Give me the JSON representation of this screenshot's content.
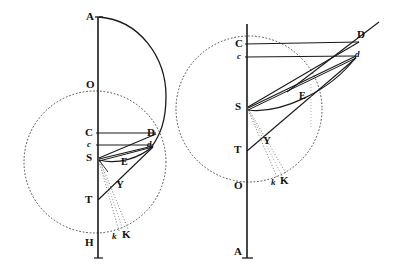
{
  "figure": {
    "background_color": "#ffffff",
    "ink_color": "#1a1a1a",
    "dotted_color": "#555555",
    "width": 393,
    "height": 271,
    "panels": [
      {
        "name": "left-panel",
        "axis": {
          "name": "vertical-axis",
          "x": 98,
          "y_top": 17,
          "y_bottom": 258
        },
        "solid_circle": {
          "name": "major-arc",
          "cx": 98,
          "cy": 79,
          "r": 66,
          "note": "large solid arc from A bulging right down past D"
        },
        "dotted_circle": {
          "name": "dotted-circle",
          "cx": 95,
          "cy": 162,
          "r": 71
        },
        "points": [
          {
            "label": "A",
            "x": 98,
            "y": 17,
            "label_x": 86,
            "label_y": 11,
            "style": "cap"
          },
          {
            "label": "O",
            "x": 98,
            "y": 85,
            "label_x": 86,
            "label_y": 79,
            "style": "cap"
          },
          {
            "label": "C",
            "x": 98,
            "y": 133,
            "label_x": 85,
            "label_y": 127,
            "style": "cap"
          },
          {
            "label": "c",
            "x": 98,
            "y": 145,
            "label_x": 87,
            "label_y": 140,
            "style": "small"
          },
          {
            "label": "S",
            "x": 98,
            "y": 158,
            "label_x": 86,
            "label_y": 152,
            "style": "cap"
          },
          {
            "label": "T",
            "x": 98,
            "y": 200,
            "label_x": 85,
            "label_y": 194,
            "style": "cap"
          },
          {
            "label": "H",
            "x": 98,
            "y": 243,
            "label_x": 85,
            "label_y": 237,
            "style": "cap"
          },
          {
            "label": "D",
            "x": 155,
            "y": 133,
            "label_x": 147,
            "label_y": 127,
            "style": "cap"
          },
          {
            "label": "d",
            "x": 152,
            "y": 145,
            "label_x": 147,
            "label_y": 140,
            "style": "small"
          },
          {
            "label": "E",
            "x": 127,
            "y": 160,
            "label_x": 121,
            "label_y": 157,
            "style": "smallcap"
          },
          {
            "label": "Y",
            "x": 123,
            "y": 181,
            "label_x": 116,
            "label_y": 179,
            "style": "cap"
          },
          {
            "label": "k",
            "x": 117,
            "y": 234,
            "label_x": 112,
            "label_y": 232,
            "style": "small"
          },
          {
            "label": "K",
            "x": 127,
            "y": 233,
            "label_x": 122,
            "label_y": 229,
            "style": "cap"
          }
        ]
      },
      {
        "name": "right-panel",
        "axis": {
          "name": "vertical-axis",
          "x": 247,
          "y_top": 24,
          "y_bottom": 258
        },
        "dotted_circle": {
          "name": "dotted-circle",
          "cx": 249,
          "cy": 109,
          "r": 73
        },
        "points": [
          {
            "label": "C",
            "x": 247,
            "y": 44,
            "label_x": 235,
            "label_y": 38,
            "style": "cap"
          },
          {
            "label": "c",
            "x": 247,
            "y": 57,
            "label_x": 237,
            "label_y": 52,
            "style": "small"
          },
          {
            "label": "S",
            "x": 247,
            "y": 107,
            "label_x": 235,
            "label_y": 101,
            "style": "cap"
          },
          {
            "label": "T",
            "x": 247,
            "y": 150,
            "label_x": 234,
            "label_y": 144,
            "style": "cap"
          },
          {
            "label": "O",
            "x": 247,
            "y": 186,
            "label_x": 234,
            "label_y": 180,
            "style": "cap"
          },
          {
            "label": "A",
            "x": 247,
            "y": 252,
            "label_x": 234,
            "label_y": 246,
            "style": "cap"
          },
          {
            "label": "D",
            "x": 357,
            "y": 40,
            "label_x": 357,
            "label_y": 29,
            "style": "cap"
          },
          {
            "label": "d",
            "x": 353,
            "y": 55,
            "label_x": 355,
            "label_y": 50,
            "style": "small"
          },
          {
            "label": "E",
            "x": 305,
            "y": 94,
            "label_x": 299,
            "label_y": 91,
            "style": "smallcap"
          },
          {
            "label": "Y",
            "x": 270,
            "y": 138,
            "label_x": 263,
            "label_y": 135,
            "style": "cap"
          },
          {
            "label": "k",
            "x": 276,
            "y": 180,
            "label_x": 271,
            "label_y": 178,
            "style": "small"
          },
          {
            "label": "K",
            "x": 286,
            "y": 179,
            "label_x": 280,
            "label_y": 175,
            "style": "cap"
          }
        ]
      }
    ],
    "chart_data": {
      "type": "scatter",
      "title": "Geometric construction: two conic/orbital figures",
      "xlabel": "",
      "ylabel": "",
      "series": [
        {
          "name": "left-figure-points",
          "points": [
            {
              "label": "A",
              "x": 98,
              "y": 17
            },
            {
              "label": "O",
              "x": 98,
              "y": 85
            },
            {
              "label": "C",
              "x": 98,
              "y": 133
            },
            {
              "label": "c",
              "x": 98,
              "y": 145
            },
            {
              "label": "S",
              "x": 98,
              "y": 158
            },
            {
              "label": "T",
              "x": 98,
              "y": 200
            },
            {
              "label": "H",
              "x": 98,
              "y": 243
            },
            {
              "label": "D",
              "x": 155,
              "y": 133
            },
            {
              "label": "d",
              "x": 152,
              "y": 145
            },
            {
              "label": "E",
              "x": 127,
              "y": 160
            },
            {
              "label": "Y",
              "x": 123,
              "y": 181
            },
            {
              "label": "k",
              "x": 117,
              "y": 234
            },
            {
              "label": "K",
              "x": 127,
              "y": 233
            }
          ]
        },
        {
          "name": "right-figure-points",
          "points": [
            {
              "label": "C",
              "x": 247,
              "y": 44
            },
            {
              "label": "c",
              "x": 247,
              "y": 57
            },
            {
              "label": "S",
              "x": 247,
              "y": 107
            },
            {
              "label": "T",
              "x": 247,
              "y": 150
            },
            {
              "label": "O",
              "x": 247,
              "y": 186
            },
            {
              "label": "A",
              "x": 247,
              "y": 252
            },
            {
              "label": "D",
              "x": 357,
              "y": 40
            },
            {
              "label": "d",
              "x": 353,
              "y": 55
            },
            {
              "label": "E",
              "x": 305,
              "y": 94
            },
            {
              "label": "Y",
              "x": 270,
              "y": 138
            },
            {
              "label": "k",
              "x": 276,
              "y": 180
            },
            {
              "label": "K",
              "x": 286,
              "y": 179
            }
          ]
        }
      ],
      "legend": [],
      "grid": false
    }
  }
}
